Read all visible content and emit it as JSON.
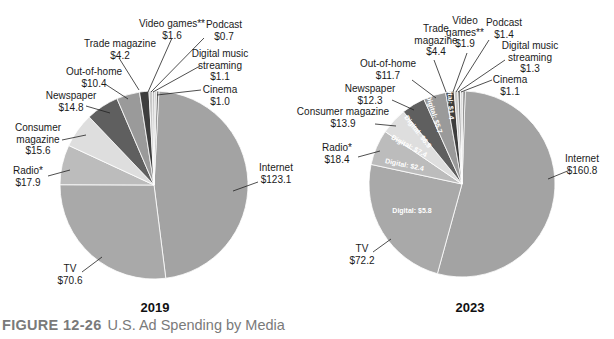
{
  "caption": {
    "figure_number": "FIGURE 12-26",
    "title": "U.S. Ad Spending by Media"
  },
  "chart_data": [
    {
      "type": "pie",
      "title": "2019",
      "units": "$ billions",
      "categories": [
        "Internet",
        "TV",
        "Radio*",
        "Consumer magazine",
        "Newspaper",
        "Out-of-home",
        "Trade magazine",
        "Video games**",
        "Podcast",
        "Digital music streaming",
        "Cinema"
      ],
      "values": [
        123.1,
        70.6,
        17.9,
        15.6,
        14.8,
        10.4,
        4.2,
        1.6,
        0.7,
        1.1,
        1.0
      ],
      "labels": [
        "$123.1",
        "$70.6",
        "$17.9",
        "$15.6",
        "$14.8",
        "$10.4",
        "$4.2",
        "$1.6",
        "$0.7",
        "$1.1",
        "$1.0"
      ],
      "colors": [
        "#a3a3a3",
        "#a9a9a9",
        "#bcbcbc",
        "#dedede",
        "#5f5f5f",
        "#9a9a9a",
        "#3e3e3e",
        "#c8c8c8",
        "#7a7a7a",
        "#d2d2d2",
        "#6a6a6a"
      ]
    },
    {
      "type": "pie",
      "title": "2023",
      "units": "$ billions",
      "categories": [
        "Internet",
        "TV",
        "Radio*",
        "Consumer magazine",
        "Newspaper",
        "Out-of-home",
        "Trade magazine",
        "Video games**",
        "Podcast",
        "Digital music streaming",
        "Cinema"
      ],
      "values": [
        160.8,
        72.2,
        18.4,
        13.9,
        12.3,
        11.7,
        4.4,
        1.9,
        1.4,
        1.3,
        1.1
      ],
      "labels": [
        "$160.8",
        "$72.2",
        "$18.4",
        "$13.9",
        "$12.3",
        "$11.7",
        "$4.4",
        "$1.9",
        "$1.4",
        "$1.3",
        "$1.1"
      ],
      "digital_annotations": [
        {
          "category": "TV",
          "text": "Digital: $5.8"
        },
        {
          "category": "Radio*",
          "text": "Digital: $2.4"
        },
        {
          "category": "Consumer magazine",
          "text": "Digital: $7.4"
        },
        {
          "category": "Newspaper",
          "text": "Digital: $6.9"
        },
        {
          "category": "Out-of-home",
          "text": "Digital: $5.7"
        },
        {
          "category": "Trade magazine",
          "text": "Digital: $1.4"
        }
      ],
      "colors": [
        "#a3a3a3",
        "#a9a9a9",
        "#bcbcbc",
        "#dedede",
        "#5f5f5f",
        "#9a9a9a",
        "#3e3e3e",
        "#c8c8c8",
        "#7a7a7a",
        "#d2d2d2",
        "#6a6a6a"
      ]
    }
  ],
  "annotations_2019": [
    {
      "name": "Video games**",
      "lines": [
        "Video games**",
        "$1.6"
      ]
    },
    {
      "name": "Podcast",
      "lines": [
        "Podcast",
        "$0.7"
      ]
    },
    {
      "name": "Trade magazine",
      "lines": [
        "Trade magazine",
        "$4.2"
      ]
    },
    {
      "name": "Digital music streaming",
      "lines": [
        "Digital music",
        "streaming",
        "$1.1"
      ]
    },
    {
      "name": "Out-of-home",
      "lines": [
        "Out-of-home",
        "$10.4"
      ]
    },
    {
      "name": "Cinema",
      "lines": [
        "Cinema",
        "$1.0"
      ]
    },
    {
      "name": "Newspaper",
      "lines": [
        "Newspaper",
        "$14.8"
      ]
    },
    {
      "name": "Consumer magazine",
      "lines": [
        "Consumer",
        "magazine",
        "$15.6"
      ]
    },
    {
      "name": "Radio*",
      "lines": [
        "Radio*",
        "$17.9"
      ]
    },
    {
      "name": "Internet",
      "lines": [
        "Internet",
        "$123.1"
      ]
    },
    {
      "name": "TV",
      "lines": [
        "TV",
        "$70.6"
      ]
    }
  ],
  "annotations_2023": [
    {
      "name": "Video games**",
      "lines": [
        "Video",
        "games**",
        "$1.9"
      ]
    },
    {
      "name": "Podcast",
      "lines": [
        "Podcast",
        "$1.4"
      ]
    },
    {
      "name": "Trade magazine",
      "lines": [
        "Trade",
        "magazine",
        "$4.4"
      ]
    },
    {
      "name": "Digital music streaming",
      "lines": [
        "Digital music",
        "streaming",
        "$1.3"
      ]
    },
    {
      "name": "Out-of-home",
      "lines": [
        "Out-of-home",
        "$11.7"
      ]
    },
    {
      "name": "Cinema",
      "lines": [
        "Cinema",
        "$1.1"
      ]
    },
    {
      "name": "Newspaper",
      "lines": [
        "Newspaper",
        "$12.3"
      ]
    },
    {
      "name": "Consumer magazine",
      "lines": [
        "Consumer magazine",
        "$13.9"
      ]
    },
    {
      "name": "Radio*",
      "lines": [
        "Radio*",
        "$18.4"
      ]
    },
    {
      "name": "Internet",
      "lines": [
        "Internet",
        "$160.8"
      ]
    },
    {
      "name": "TV",
      "lines": [
        "TV",
        "$72.2"
      ]
    }
  ]
}
